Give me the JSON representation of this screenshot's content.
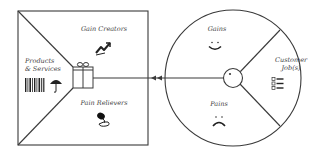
{
  "diagram": {
    "colors": {
      "stroke": "#3a3a3a",
      "text": "#444444",
      "background": "#ffffff"
    },
    "value_map": {
      "shape": "square",
      "sections": [
        {
          "label": "Gain Creators",
          "icon": "trending-up-chart-icon"
        },
        {
          "label": "Products\n& Services",
          "icon": [
            "barcode-icon",
            "umbrella-icon"
          ]
        },
        {
          "label": "Pain Relievers",
          "icon": "pill-medicine-icon"
        }
      ],
      "center_icon": "gift-box-icon"
    },
    "connector": {
      "direction": "from customer profile to value map",
      "arrow_icon": "double-arrowhead-left-icon"
    },
    "customer_profile": {
      "shape": "circle",
      "sections": [
        {
          "label": "Gains",
          "icon": "smiley-face-icon"
        },
        {
          "label": "Customer\nJob(s)",
          "icon": "checklist-icon"
        },
        {
          "label": "Pains",
          "icon": "sad-face-icon"
        }
      ],
      "center_icon": "person-head-icon"
    }
  }
}
